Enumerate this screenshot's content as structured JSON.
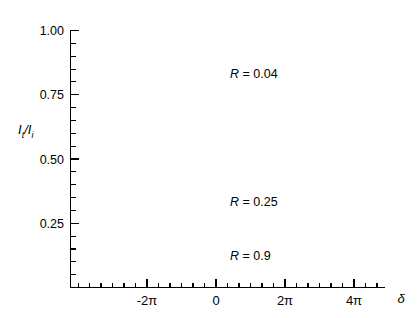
{
  "figure": {
    "background_color": "#ffffff",
    "line_color": "#1a1a1a",
    "axis_color": "#000000"
  },
  "axes": {
    "y_axis_title": "I_t /I_i",
    "y_axis_title_parts": {
      "i1": "I",
      "sub1": "t",
      "slash": "/",
      "i2": "I",
      "sub2": "i"
    },
    "x_axis_title": "δ",
    "y_tick_labels": [
      "1.00",
      "0.75",
      "0.50",
      "0.25"
    ],
    "y_tick_values": [
      1.0,
      0.75,
      0.5,
      0.25
    ],
    "x_tick_labels": [
      "-2π",
      "0",
      "2π",
      "4π"
    ],
    "x_tick_values": [
      -6.283185307,
      0,
      6.283185307,
      12.566370614
    ]
  },
  "curve_labels": [
    {
      "text": "R = 0.04",
      "r_symbol": "R",
      "eq_value": " = 0.04"
    },
    {
      "text": "R = 0.25",
      "r_symbol": "R",
      "eq_value": " = 0.25"
    },
    {
      "text": "R = 0.9",
      "r_symbol": "R",
      "eq_value": " = 0.9"
    }
  ],
  "chart_data": {
    "type": "line",
    "title": "",
    "subtitle": "",
    "xlabel": "δ",
    "ylabel": "I_t /I_i",
    "xlim": [
      -9.9,
      16.3
    ],
    "ylim": [
      0.0,
      1.03
    ],
    "grid": false,
    "legend": "inline-annotations",
    "x_tick_labels": [
      "-2π",
      "0",
      "2π",
      "4π"
    ],
    "x_tick_values": [
      -6.283185307,
      0,
      6.283185307,
      12.566370614
    ],
    "x_minor_tick_step": 1.0471975512,
    "y_tick_labels": [
      "1.00",
      "0.75",
      "0.50",
      "0.25"
    ],
    "y_tick_values": [
      1.0,
      0.75,
      0.5,
      0.25
    ],
    "y_minor_tick_step": 0.05,
    "formula": "I_t/I_i = 1 / (1 + F sin^2(delta/2)), F = 4R/(1-R)^2",
    "series": [
      {
        "name": "R = 0.04",
        "R": 0.04,
        "F": 0.17361,
        "peak_value": 1.0,
        "min_value": 0.852,
        "peak_positions": [
          -12.566370614,
          -6.283185307,
          0,
          6.283185307,
          12.566370614
        ],
        "label_position": {
          "x": 3.1,
          "y": 0.74
        }
      },
      {
        "name": "R = 0.25",
        "R": 0.25,
        "F": 1.77778,
        "peak_value": 1.0,
        "min_value": 0.36,
        "peak_positions": [
          -12.566370614,
          -6.283185307,
          0,
          6.283185307,
          12.566370614
        ],
        "label_position": {
          "x": 3.1,
          "y": 0.365
        }
      },
      {
        "name": "R = 0.9",
        "R": 0.9,
        "F": 360.0,
        "peak_value": 1.0,
        "min_value": 0.00277,
        "peak_positions": [
          -12.566370614,
          -6.283185307,
          0,
          6.283185307,
          12.566370614
        ],
        "label_position": {
          "x": 3.1,
          "y": 0.155
        }
      }
    ]
  }
}
